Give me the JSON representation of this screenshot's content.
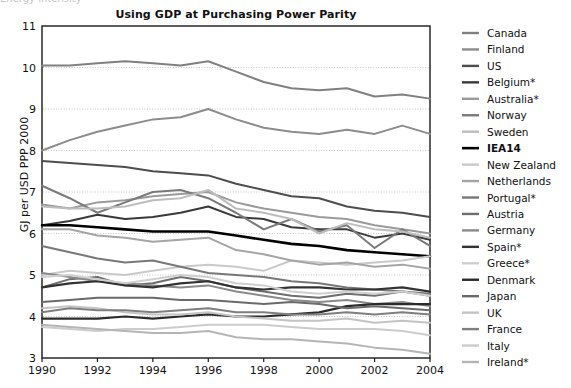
{
  "figure": {
    "title": "Using GDP at Purchasing Power Parity",
    "ylabel": "GJ per USD PPP 2000",
    "cut_off_header": "Energy intensity"
  },
  "chart_data": {
    "type": "line",
    "title": "Using GDP at Purchasing Power Parity",
    "xlabel": "",
    "ylabel": "GJ per USD PPP 2000",
    "xlim": [
      1990,
      2004
    ],
    "ylim": [
      3,
      11
    ],
    "xticks": [
      1990,
      1992,
      1994,
      1996,
      1998,
      2000,
      2002,
      2004
    ],
    "yticks": [
      3,
      4,
      5,
      6,
      7,
      8,
      9,
      10,
      11
    ],
    "grid": "horizontal-dotted",
    "legend_position": "right",
    "x": [
      1990,
      1991,
      1992,
      1993,
      1994,
      1995,
      1996,
      1997,
      1998,
      1999,
      2000,
      2001,
      2002,
      2003,
      2004
    ],
    "series": [
      {
        "name": "Canada",
        "color": "#808080",
        "width": 2.0,
        "values": [
          10.05,
          10.05,
          10.1,
          10.15,
          10.1,
          10.05,
          10.15,
          9.9,
          9.65,
          9.5,
          9.45,
          9.5,
          9.3,
          9.35,
          9.25
        ]
      },
      {
        "name": "Finland",
        "color": "#8c8c8c",
        "width": 2.0,
        "values": [
          8.0,
          8.25,
          8.45,
          8.6,
          8.75,
          8.8,
          9.0,
          8.75,
          8.55,
          8.45,
          8.4,
          8.5,
          8.4,
          8.6,
          8.4
        ]
      },
      {
        "name": "US",
        "color": "#4d4d4d",
        "width": 2.0,
        "values": [
          7.75,
          7.7,
          7.65,
          7.6,
          7.5,
          7.45,
          7.4,
          7.2,
          7.05,
          6.9,
          6.85,
          6.65,
          6.55,
          6.5,
          6.4
        ]
      },
      {
        "name": "Belgium*",
        "color": "#3a3a3a",
        "width": 2.0,
        "values": [
          6.2,
          6.3,
          6.45,
          6.35,
          6.4,
          6.5,
          6.65,
          6.4,
          6.35,
          6.15,
          6.1,
          6.1,
          5.9,
          6.0,
          5.85
        ]
      },
      {
        "name": "Australia*",
        "color": "#9a9a9a",
        "width": 2.0,
        "values": [
          6.7,
          6.6,
          6.75,
          6.8,
          6.9,
          6.95,
          7.0,
          6.75,
          6.6,
          6.5,
          6.4,
          6.35,
          6.2,
          6.1,
          6.0
        ]
      },
      {
        "name": "Norway",
        "color": "#7a7a7a",
        "width": 2.0,
        "values": [
          7.15,
          6.85,
          6.5,
          6.75,
          7.0,
          7.05,
          6.85,
          6.5,
          6.1,
          6.35,
          6.05,
          6.2,
          5.65,
          6.1,
          5.7
        ]
      },
      {
        "name": "Sweden",
        "color": "#bdbdbd",
        "width": 2.0,
        "values": [
          6.65,
          6.6,
          6.6,
          6.65,
          6.8,
          6.85,
          7.05,
          6.6,
          6.5,
          6.35,
          6.0,
          6.25,
          6.1,
          6.05,
          5.9
        ]
      },
      {
        "name": "IEA14",
        "color": "#000000",
        "width": 2.6,
        "values": [
          6.2,
          6.2,
          6.15,
          6.1,
          6.05,
          6.05,
          6.05,
          5.95,
          5.85,
          5.75,
          5.7,
          5.6,
          5.55,
          5.5,
          5.45
        ]
      },
      {
        "name": "New Zealand",
        "color": "#c9c9c9",
        "width": 2.0,
        "values": [
          5.0,
          5.1,
          5.05,
          5.0,
          5.1,
          5.2,
          5.25,
          5.2,
          5.1,
          5.35,
          5.3,
          5.25,
          5.3,
          5.35,
          5.45
        ]
      },
      {
        "name": "Netherlands",
        "color": "#a5a5a5",
        "width": 2.0,
        "values": [
          6.1,
          6.1,
          5.95,
          5.9,
          5.8,
          5.85,
          5.9,
          5.6,
          5.5,
          5.35,
          5.25,
          5.3,
          5.2,
          5.25,
          5.15
        ]
      },
      {
        "name": "Portugal*",
        "color": "#787878",
        "width": 2.0,
        "values": [
          5.7,
          5.55,
          5.4,
          5.3,
          5.35,
          5.2,
          5.05,
          5.0,
          4.95,
          4.85,
          4.8,
          4.7,
          4.65,
          4.6,
          4.55
        ]
      },
      {
        "name": "Austria",
        "color": "#6e6e6e",
        "width": 2.0,
        "values": [
          4.7,
          4.9,
          4.95,
          4.75,
          4.8,
          4.95,
          4.85,
          4.7,
          4.6,
          4.5,
          4.45,
          4.55,
          4.5,
          4.6,
          4.5
        ]
      },
      {
        "name": "Germany",
        "color": "#8a8a8a",
        "width": 2.0,
        "values": [
          5.05,
          4.95,
          4.85,
          4.8,
          4.75,
          4.7,
          4.75,
          4.6,
          4.5,
          4.4,
          4.35,
          4.4,
          4.3,
          4.35,
          4.25
        ]
      },
      {
        "name": "Spain*",
        "color": "#333333",
        "width": 2.2,
        "values": [
          4.7,
          4.8,
          4.85,
          4.75,
          4.7,
          4.8,
          4.85,
          4.7,
          4.65,
          4.7,
          4.7,
          4.65,
          4.65,
          4.7,
          4.6
        ]
      },
      {
        "name": "Greece*",
        "color": "#cfcfcf",
        "width": 2.0,
        "values": [
          4.95,
          5.0,
          4.9,
          4.8,
          4.9,
          5.0,
          4.95,
          4.8,
          4.75,
          4.6,
          4.55,
          4.6,
          4.55,
          4.6,
          4.5
        ]
      },
      {
        "name": "Denmark",
        "color": "#2b2b2b",
        "width": 2.2,
        "values": [
          3.95,
          3.95,
          3.95,
          4.0,
          3.95,
          4.0,
          4.05,
          4.0,
          4.0,
          4.05,
          4.1,
          4.25,
          4.3,
          4.3,
          4.3
        ]
      },
      {
        "name": "Japan",
        "color": "#6a6a6a",
        "width": 2.0,
        "values": [
          4.35,
          4.4,
          4.45,
          4.45,
          4.45,
          4.4,
          4.4,
          4.35,
          4.3,
          4.35,
          4.3,
          4.2,
          4.25,
          4.2,
          4.15
        ]
      },
      {
        "name": "UK",
        "color": "#c4c4c4",
        "width": 2.0,
        "values": [
          4.2,
          4.25,
          4.2,
          4.1,
          4.05,
          4.05,
          4.1,
          4.0,
          3.95,
          3.9,
          3.9,
          3.95,
          3.85,
          3.9,
          3.85
        ]
      },
      {
        "name": "France",
        "color": "#7f7f7f",
        "width": 2.0,
        "values": [
          4.1,
          4.2,
          4.15,
          4.15,
          4.1,
          4.15,
          4.2,
          4.1,
          4.1,
          4.05,
          4.05,
          4.1,
          4.05,
          4.1,
          4.05
        ]
      },
      {
        "name": "Italy",
        "color": "#cccccc",
        "width": 2.0,
        "values": [
          3.75,
          3.7,
          3.65,
          3.7,
          3.7,
          3.75,
          3.8,
          3.8,
          3.8,
          3.75,
          3.7,
          3.7,
          3.7,
          3.65,
          3.55
        ]
      },
      {
        "name": "Ireland*",
        "color": "#b5b5b5",
        "width": 2.0,
        "values": [
          3.8,
          3.75,
          3.7,
          3.65,
          3.6,
          3.6,
          3.65,
          3.5,
          3.45,
          3.45,
          3.4,
          3.35,
          3.25,
          3.2,
          3.1
        ]
      }
    ]
  }
}
